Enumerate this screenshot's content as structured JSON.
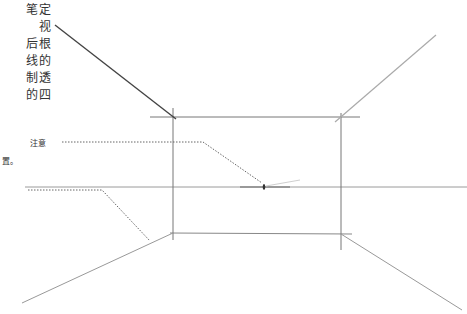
{
  "text_column": {
    "lines": [
      "笔定",
      "视",
      "后根",
      "线的",
      "制透",
      "的四"
    ]
  },
  "annotations": {
    "note_1": "注意",
    "note_2": "置。"
  },
  "geometry": {
    "rectangle": {
      "left": 173,
      "top": 117,
      "right": 341,
      "bottom": 233
    },
    "horizon_y": 187,
    "vanishing_point": {
      "x": 264,
      "y": 187
    }
  },
  "colors": {
    "line": "#555555",
    "light_line": "#999999",
    "text": "#333333"
  }
}
